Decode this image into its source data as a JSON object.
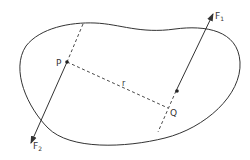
{
  "diagram": {
    "type": "physics-couple",
    "colors": {
      "stroke": "#333333",
      "background": "#ffffff"
    },
    "labels": {
      "point_p": "P",
      "point_q": "Q",
      "distance": "r",
      "force1": "F",
      "force1_sub": "1",
      "force2": "F",
      "force2_sub": "2"
    }
  }
}
